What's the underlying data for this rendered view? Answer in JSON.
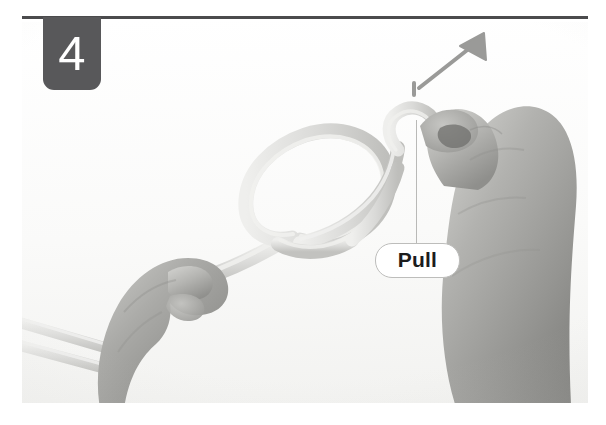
{
  "step": {
    "number": "4",
    "badge_color": "#58585a",
    "badge_text_color": "#ffffff",
    "rule_color": "#4b4b4d"
  },
  "callout": {
    "label": "Pull",
    "border_color": "#bdbdbb",
    "text_color": "#1c1c1c",
    "leader_color": "#b9b9b7"
  },
  "arrow": {
    "name": "direction-arrow",
    "color": "#9a9a98",
    "direction": "up-right"
  },
  "photo": {
    "description": "Two hands tying a knot in a light gray rope",
    "background_color": "#fbfbfa",
    "rope_color": "#d8d8d6",
    "skin_color": "#a9a9a6",
    "elements": [
      {
        "name": "left-hand",
        "description": "Left hand gripping the standing part of the rope"
      },
      {
        "name": "right-hand",
        "description": "Right hand pinching the working end of the rope"
      },
      {
        "name": "rope-loop",
        "description": "Overhand loop of the forming knot"
      },
      {
        "name": "rope-tails",
        "description": "Two rope tails exiting to the lower left"
      }
    ]
  }
}
